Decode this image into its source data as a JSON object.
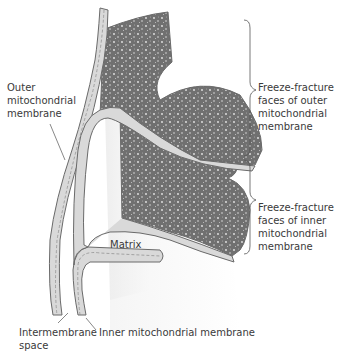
{
  "diagram": {
    "labels": {
      "outer_membrane": "Outer\nmitochondrial\nmembrane",
      "ff_outer": "Freeze-fracture\nfaces of outer\nmitochondrial\nmembrane",
      "ff_inner": "Freeze-fracture\nfaces of inner\nmitochondrial\nmembrane",
      "matrix": "Matrix",
      "intermembrane_space": "Intermembrane\nspace",
      "inner_membrane": "Inner mitochondrial membrane"
    },
    "colors": {
      "membrane_fill": "#d9d9d9",
      "membrane_stroke": "#6a6a6a",
      "fracture_face": "#6e6e6e",
      "matrix_bg": "#efefef",
      "text": "#3a3a3a"
    }
  }
}
